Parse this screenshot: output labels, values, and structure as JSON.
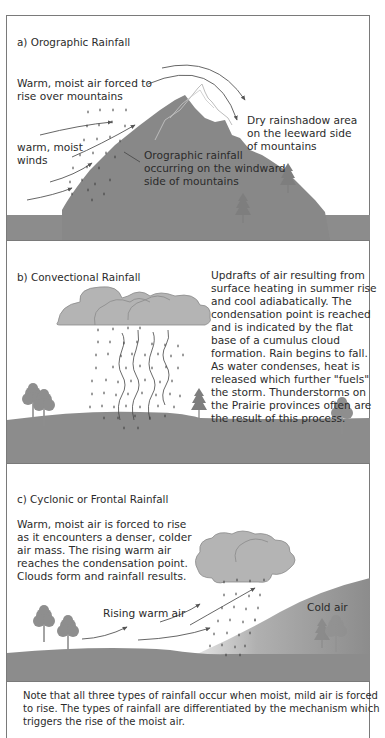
{
  "sections": {
    "a": {
      "title": "a) Orographic Rainfall",
      "label_forced": [
        "Warm, moist air forced to",
        "rise over mountains"
      ],
      "label_winds": [
        "warm, moist",
        "winds"
      ],
      "label_windward": [
        "Orographic rainfall",
        "occurring on the windward",
        "side of mountains"
      ],
      "label_leeward": [
        "Dry rainshadow area",
        "on the leeward side",
        "of  mountains"
      ]
    },
    "b": {
      "title": "b) Convectional Rainfall",
      "description": [
        "Updrafts of air resulting from",
        "surface heating in summer rise",
        "and cool adiabatically. The",
        "condensation point is reached",
        "and is indicated by the flat",
        "base of a cumulus cloud",
        "formation. Rain begins to fall.",
        "As water condenses, heat is",
        "released which further \"fuels\"",
        "the storm. Thunderstorms  on",
        "the Prairie provinces often are",
        "the result of this process."
      ]
    },
    "c": {
      "title": "c) Cyclonic or Frontal Rainfall",
      "description": [
        "Warm, moist air is forced to rise",
        "as it encounters a denser, colder",
        "air mass. The rising warm air",
        "reaches the condensation point.",
        "Clouds form and rainfall results."
      ],
      "label_rising": "Rising warm air",
      "label_cold": "Cold air"
    }
  },
  "footnote": [
    "Note that all three types of rainfall occur when moist, mild air is forced",
    "to rise.  The types of rainfall are differentiated by the mechanism which",
    "triggers the rise of the moist air."
  ],
  "colors": {
    "ground": "#8c8c8c",
    "mountain": "#888888",
    "cloud": "#b4b4b4",
    "cloud_stroke": "#8a8a8a",
    "tree": "#8e8e8e",
    "rain": "#3a3a3a",
    "arrow": "#555555",
    "border": "#7a7a7a"
  }
}
